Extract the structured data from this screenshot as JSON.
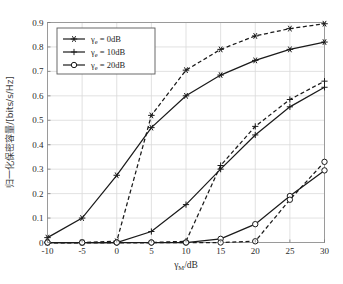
{
  "figure": {
    "top_caption": "",
    "background_color": "#ffffff",
    "frame_color": "#9a9a9a",
    "grid_color": "#d9d9d9",
    "curve_color": "#1a1a1a"
  },
  "axes": {
    "x": {
      "label": "γ_M/dB",
      "label_base": "γ",
      "label_sub": "M",
      "label_unit": "/dB",
      "ticks": [
        -10,
        -5,
        0,
        5,
        10,
        15,
        20,
        25,
        30
      ],
      "tick_labels": [
        "-10",
        "-5",
        "0",
        "5",
        "10",
        "15",
        "20",
        "25",
        "30"
      ],
      "min": -10,
      "max": 30
    },
    "y": {
      "label": "归一化保密容量/[bits/s/Hz]",
      "ticks": [
        0,
        0.1,
        0.2,
        0.3,
        0.4,
        0.5,
        0.6,
        0.7,
        0.8,
        0.9
      ],
      "tick_labels": [
        "0",
        "0.1",
        "0.2",
        "0.3",
        "0.4",
        "0.5",
        "0.6",
        "0.7",
        "0.8",
        "0.9"
      ],
      "min": 0,
      "max": 0.9
    },
    "grid": true
  },
  "legend": {
    "position": "upper-left-inside",
    "entries": [
      {
        "marker": "star",
        "base": "γ",
        "sub": "e",
        "text": " = 0dB",
        "full": "γe = 0dB"
      },
      {
        "marker": "plus",
        "base": "γ",
        "sub": "e",
        "text": " = 10dB",
        "full": "γe = 10dB"
      },
      {
        "marker": "circle",
        "base": "γ",
        "sub": "e",
        "text": " = 20dB",
        "full": "γe = 20dB"
      }
    ]
  },
  "chart_data": {
    "type": "line",
    "title": "",
    "xlabel": "γ_M/dB",
    "ylabel": "归一化保密容量/[bits/s/Hz]",
    "xlim": [
      -10,
      30
    ],
    "ylim": [
      0,
      0.9
    ],
    "grid": true,
    "x": [
      -10,
      -5,
      0,
      5,
      10,
      15,
      20,
      25,
      30
    ],
    "series": [
      {
        "name": "γe = 0dB (solid)",
        "marker": "star",
        "style": "solid",
        "values": [
          0.02,
          0.1,
          0.275,
          0.47,
          0.6,
          0.685,
          0.745,
          0.79,
          0.82
        ]
      },
      {
        "name": "γe = 0dB (dashed)",
        "marker": "star",
        "style": "dashed",
        "values": [
          0.0,
          0.0,
          0.005,
          0.52,
          0.705,
          0.79,
          0.845,
          0.875,
          0.895
        ]
      },
      {
        "name": "γe = 10dB (solid)",
        "marker": "plus",
        "style": "solid",
        "values": [
          0.0,
          0.0,
          0.0,
          0.045,
          0.155,
          0.3,
          0.44,
          0.555,
          0.635
        ]
      },
      {
        "name": "γe = 10dB (dashed)",
        "marker": "plus",
        "style": "dashed",
        "values": [
          0.0,
          0.0,
          0.0,
          0.0,
          0.005,
          0.315,
          0.475,
          0.585,
          0.66
        ]
      },
      {
        "name": "γe = 20dB (solid)",
        "marker": "circle",
        "style": "solid",
        "values": [
          0.0,
          0.0,
          0.0,
          0.0,
          0.0,
          0.015,
          0.075,
          0.19,
          0.295
        ]
      },
      {
        "name": "γe = 20dB (dashed)",
        "marker": "circle",
        "style": "dashed",
        "values": [
          0.0,
          0.0,
          0.0,
          0.0,
          0.0,
          0.0,
          0.005,
          0.175,
          0.33
        ]
      }
    ]
  }
}
